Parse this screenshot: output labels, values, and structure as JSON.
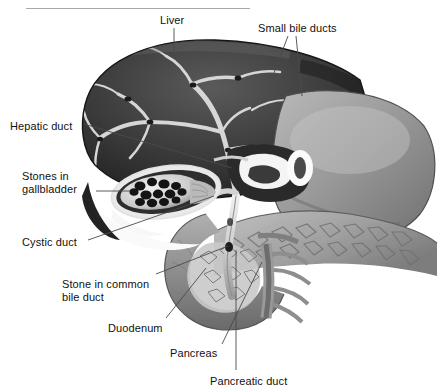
{
  "figure": {
    "title_rule": "horizontal-rule",
    "background_color": "#ffffff",
    "line_color": "#4a4a4a",
    "text_color": "#111111"
  },
  "labels": [
    {
      "id": "liver",
      "text": "Liver",
      "x": 160,
      "y": 14
    },
    {
      "id": "small-bile-ducts",
      "text": "Small bile ducts",
      "x": 258,
      "y": 22
    },
    {
      "id": "hepatic-duct",
      "text": "Hepatic duct",
      "x": 10,
      "y": 120
    },
    {
      "id": "stones-in-gallbladder",
      "line1": "Stones in",
      "line2": "gallbladder",
      "x": 22,
      "y": 170
    },
    {
      "id": "cystic-duct",
      "text": "Cystic duct",
      "x": 22,
      "y": 236
    },
    {
      "id": "stone-in-common-bile-duct",
      "line1": "Stone in common",
      "line2": "bile duct",
      "x": 62,
      "y": 278
    },
    {
      "id": "duodenum",
      "text": "Duodenum",
      "x": 108,
      "y": 322
    },
    {
      "id": "pancreas",
      "text": "Pancreas",
      "x": 170,
      "y": 347
    },
    {
      "id": "pancreatic-duct",
      "text": "Pancreatic duct",
      "x": 210,
      "y": 375
    }
  ],
  "structures": {
    "liver": "large dark lobe, upper-left, with pale branching bile ducts and small dark stones",
    "gallbladder": "cut-open oval sac containing a cluster of dark gallstones",
    "stomach": "large mid-gray mass, right side",
    "duodenum": "C-shaped loop around the pancreatic head, lower middle",
    "pancreas": "textured lobular gland extending to the right edge",
    "common_bile_duct": "vertical duct descending from the hepatic duct junction"
  },
  "colors": {
    "liver_dark": "#2b2b2b",
    "liver_mid": "#4a4a4a",
    "duct_light": "#d8d8d8",
    "organ_gray": "#8e8e8e",
    "organ_light": "#b5b5b5",
    "stone_dark": "#1c1c1c",
    "highlight": "#f2f2f2"
  }
}
